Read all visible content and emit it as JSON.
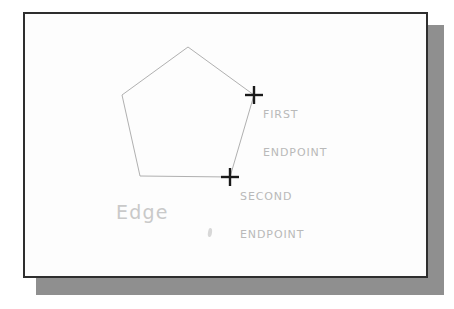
{
  "figure": {
    "name": "cad-pentagon-edge-endpoints-diagram",
    "background_color": "#ffffff",
    "card": {
      "fill_color": "#fdfdfd",
      "border_color": "#2e2e2e",
      "shadow_color": "#8f8f8f"
    },
    "shape": {
      "name": "pentagon",
      "stroke_color": "#b0b0b0",
      "vertices": [
        {
          "x": 188,
          "y": 47
        },
        {
          "x": 254,
          "y": 95
        },
        {
          "x": 230,
          "y": 177
        },
        {
          "x": 140,
          "y": 176
        },
        {
          "x": 122,
          "y": 95
        }
      ]
    },
    "markers": [
      {
        "name": "first-endpoint-marker",
        "glyph": "plus-cross-icon",
        "x": 254,
        "y": 95,
        "color": "#1a1a1a"
      },
      {
        "name": "second-endpoint-marker",
        "glyph": "plus-cross-icon",
        "x": 230,
        "y": 177,
        "color": "#1a1a1a"
      }
    ],
    "labels": {
      "first_endpoint": {
        "line1": "FIRST",
        "line2": "ENDPOINT",
        "color": "#b9b9b9"
      },
      "second_endpoint": {
        "line1": "SECOND",
        "line2": "ENDPOINT",
        "color": "#b9b9b9"
      },
      "edge": {
        "text": "Edge",
        "color": "#c9c9c9"
      }
    }
  }
}
